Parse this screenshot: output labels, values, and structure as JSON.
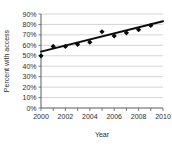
{
  "chart_data": {
    "type": "scatter",
    "title": "",
    "xlabel": "Year",
    "ylabel": "Percent with access",
    "xlim": [
      2000,
      2010
    ],
    "ylim": [
      0,
      90
    ],
    "grid": true,
    "legend": "none",
    "x_tick_labels": [
      "2000",
      "2002",
      "2004",
      "2006",
      "2008",
      "2010"
    ],
    "x_tick_values": [
      2000,
      2002,
      2004,
      2006,
      2008,
      2010
    ],
    "x_minor_ticks": [
      2001,
      2003,
      2005,
      2007,
      2009
    ],
    "y_tick_labels": [
      "0%",
      "10%",
      "20%",
      "30%",
      "40%",
      "50%",
      "60%",
      "70%",
      "80%",
      "90%"
    ],
    "y_tick_values": [
      0,
      10,
      20,
      30,
      40,
      50,
      60,
      70,
      80,
      90
    ],
    "x": [
      2000,
      2001,
      2002,
      2003,
      2004,
      2005,
      2006,
      2007,
      2008,
      2009
    ],
    "values": [
      50,
      59,
      59,
      61,
      63,
      73,
      69,
      72,
      75,
      79
    ],
    "series": [
      {
        "name": "Percent with access",
        "marker": "diamond",
        "color": "#0b0b0b",
        "values": [
          50,
          59,
          59,
          61,
          63,
          73,
          69,
          72,
          75,
          79
        ]
      },
      {
        "name": "trend line",
        "type": "line",
        "color": "#0b0b0b",
        "endpoints": [
          {
            "x": 2000,
            "y": 54
          },
          {
            "x": 2010,
            "y": 83
          }
        ]
      }
    ]
  }
}
